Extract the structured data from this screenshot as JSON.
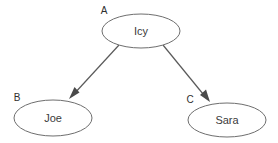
{
  "diagram": {
    "type": "directed-graph",
    "background_color": "#ffffff",
    "node_stroke_color": "#6e6e6e",
    "node_fill_color": "#ffffff",
    "edge_color": "#5a5a5a",
    "label_color": "#3b3b3b",
    "tag_color": "#2f2f2f",
    "nodes": [
      {
        "id": "A",
        "tag": "A",
        "label": "Icy",
        "shape": "ellipse",
        "cx": 141,
        "cy": 31,
        "rx": 39,
        "ry": 17,
        "tag_x": 104,
        "tag_y": 11
      },
      {
        "id": "B",
        "tag": "B",
        "label": "Joe",
        "shape": "ellipse",
        "cx": 53,
        "cy": 118,
        "rx": 39,
        "ry": 18,
        "tag_x": 17,
        "tag_y": 98
      },
      {
        "id": "C",
        "tag": "C",
        "label": "Sara",
        "shape": "ellipse",
        "cx": 227,
        "cy": 120,
        "rx": 39,
        "ry": 17,
        "tag_x": 190,
        "tag_y": 100
      }
    ],
    "edges": [
      {
        "id": "edge-a-b",
        "from": "A",
        "to": "B",
        "x1": 119,
        "y1": 45,
        "x2": 70,
        "y2": 98,
        "arrowhead": "filled-triangle"
      },
      {
        "id": "edge-a-c",
        "from": "A",
        "to": "C",
        "x1": 163,
        "y1": 45,
        "x2": 209,
        "y2": 101,
        "arrowhead": "filled-triangle"
      }
    ]
  }
}
